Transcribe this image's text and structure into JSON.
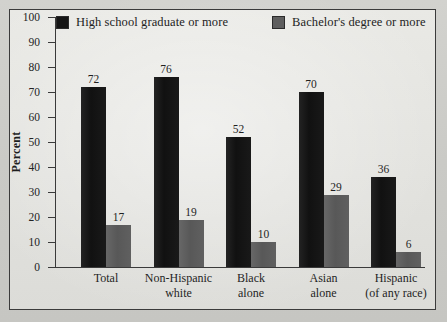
{
  "figure": {
    "background_color": "#cdcdc9",
    "panel_color": "#e3e3df",
    "border_color": "#3b3b3b"
  },
  "legend": {
    "entries": [
      {
        "label": "High school graduate or more",
        "swatch_name": "legend-swatch-high-school",
        "color": "#151515"
      },
      {
        "label": "Bachelor's degree or more",
        "swatch_name": "legend-swatch-bachelors",
        "color": "#5e5e5e"
      }
    ]
  },
  "axes": {
    "ylabel": "Percent",
    "yticks": [
      "0",
      "10",
      "20",
      "30",
      "40",
      "50",
      "60",
      "70",
      "80",
      "90",
      "100"
    ]
  },
  "chart_data": {
    "type": "bar",
    "title": "",
    "xlabel": "",
    "ylabel": "Percent",
    "ylim": [
      0,
      100
    ],
    "ytick_step": 10,
    "grid": false,
    "legend_position": "top",
    "categories": [
      "Total",
      "Non-Hispanic white",
      "Black alone",
      "Asian alone",
      "Hispanic (of any race)"
    ],
    "category_lines": [
      [
        "Total"
      ],
      [
        "Non-Hispanic",
        "white"
      ],
      [
        "Black",
        "alone"
      ],
      [
        "Asian",
        "alone"
      ],
      [
        "Hispanic",
        "(of any race)"
      ]
    ],
    "series": [
      {
        "name": "High school graduate or more",
        "color": "#151515",
        "values": [
          72,
          76,
          52,
          70,
          36
        ]
      },
      {
        "name": "Bachelor's degree or more",
        "color": "#5e5e5e",
        "values": [
          17,
          19,
          10,
          29,
          6
        ]
      }
    ]
  }
}
